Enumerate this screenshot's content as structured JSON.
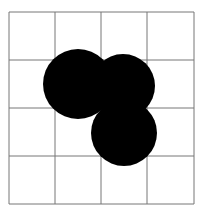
{
  "figure": {
    "grid": {
      "x_lines": [
        9,
        55,
        101,
        147,
        194
      ],
      "y_lines": [
        12,
        60,
        108,
        156,
        204
      ],
      "stroke": "#777777",
      "rows": 4,
      "cols": 4
    },
    "circles": [
      {
        "name": "circle-1",
        "cx": 78,
        "cy": 84,
        "r": 35,
        "fill": "#000000"
      },
      {
        "name": "circle-2",
        "cx": 123,
        "cy": 86,
        "r": 32,
        "fill": "#000000"
      },
      {
        "name": "circle-3",
        "cx": 124,
        "cy": 133,
        "r": 33,
        "fill": "#000000"
      }
    ]
  }
}
